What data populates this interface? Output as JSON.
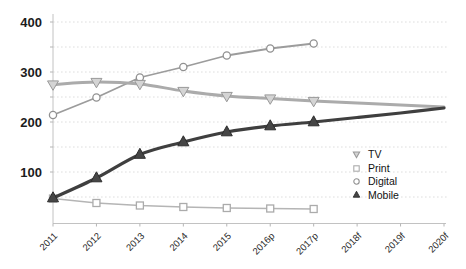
{
  "chart_data": {
    "type": "line",
    "title": "",
    "xlabel": "",
    "ylabel": "",
    "categories": [
      "2011",
      "2012",
      "2013",
      "2014",
      "2015",
      "2016p",
      "2017p",
      "2018f",
      "2019f",
      "2020f"
    ],
    "series": [
      {
        "name": "TV",
        "marker": "triangle-down",
        "color": "#ababab",
        "marker_fill": "#d4d4d4",
        "marker_stroke": "#999999",
        "line_width": 3,
        "smooth": true,
        "markers_through": 6,
        "values": [
          275,
          280,
          276,
          262,
          252,
          247,
          242,
          238,
          234,
          230
        ]
      },
      {
        "name": "Print",
        "marker": "square",
        "color": "#b5b5b5",
        "marker_fill": "#ffffff",
        "marker_stroke": "#ababab",
        "line_width": 1.5,
        "smooth": false,
        "markers_through": 6,
        "values": [
          47,
          38,
          33,
          30,
          28,
          27,
          26,
          null,
          null,
          null
        ]
      },
      {
        "name": "Digital",
        "marker": "circle",
        "color": "#9c9c9c",
        "marker_fill": "#ffffff",
        "marker_stroke": "#919191",
        "line_width": 1.8,
        "smooth": false,
        "markers_through": 6,
        "values": [
          214,
          249,
          289,
          310,
          333,
          347,
          357,
          null,
          null,
          null
        ]
      },
      {
        "name": "Mobile",
        "marker": "triangle-up",
        "color": "#3f3f3f",
        "marker_fill": "#464646",
        "marker_stroke": "#2d2d2d",
        "line_width": 3.2,
        "smooth": true,
        "markers_through": 6,
        "values": [
          48,
          88,
          135,
          160,
          180,
          192,
          200,
          209,
          218,
          228
        ]
      }
    ],
    "ylim": [
      0,
      400
    ],
    "yticks": [
      100,
      200,
      300,
      400
    ],
    "grid_step": 50,
    "grid": "dotted-horizontal",
    "legend_position": "inside-right",
    "axis_color": "#c2c2c2",
    "grid_color": "#dedede",
    "tick_label_color": "#1c1c1c"
  }
}
